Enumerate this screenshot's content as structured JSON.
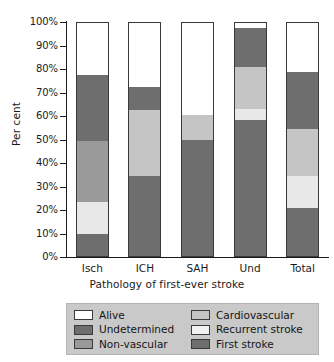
{
  "chart_data": {
    "type": "bar",
    "subtype": "stacked-percentage",
    "title": "",
    "xlabel": "Pathology of first-ever stroke",
    "ylabel": "Per cent",
    "ylim": [
      0,
      100
    ],
    "ytick_labels": [
      "100%",
      "90%",
      "80%",
      "70%",
      "60%",
      "50%",
      "40%",
      "30%",
      "20%",
      "10%",
      "0%"
    ],
    "ytick_values": [
      100,
      90,
      80,
      70,
      60,
      50,
      40,
      30,
      20,
      10,
      0
    ],
    "grid": false,
    "legend_position": "bottom",
    "categories": [
      "Isch",
      "ICH",
      "SAH",
      "Und",
      "Total"
    ],
    "series": [
      {
        "name": "First stroke",
        "color": "#6e6e6e",
        "values": [
          9.5,
          34.0,
          49.5,
          58.0,
          20.5
        ]
      },
      {
        "name": "Recurrent stroke",
        "color": "#e8e8e8",
        "values": [
          13.5,
          0.0,
          0.0,
          4.5,
          13.5
        ]
      },
      {
        "name": "Non-vascular",
        "color": "#9a9a9a",
        "values": [
          26.0,
          0.0,
          0.0,
          0.0,
          0.0
        ]
      },
      {
        "name": "Cardiovascular",
        "color": "#c5c5c5",
        "values": [
          0.0,
          28.0,
          10.5,
          18.0,
          20.0
        ]
      },
      {
        "name": "Undetermined",
        "color": "#6e6e6e",
        "values": [
          28.0,
          10.0,
          0.0,
          16.5,
          24.5
        ]
      },
      {
        "name": "Alive",
        "color": "#ffffff",
        "values": [
          23.0,
          28.0,
          40.0,
          3.0,
          21.5
        ]
      }
    ],
    "stack_order_bottom_to_top": [
      "First stroke",
      "Recurrent stroke",
      "Non-vascular",
      "Cardiovascular",
      "Undetermined",
      "Alive"
    ]
  },
  "legend": {
    "left_column": [
      {
        "label": "Alive",
        "color": "#ffffff"
      },
      {
        "label": "Undetermined",
        "color": "#6e6e6e"
      },
      {
        "label": "Non-vascular",
        "color": "#9a9a9a"
      }
    ],
    "right_column": [
      {
        "label": "Cardiovascular",
        "color": "#c5c5c5"
      },
      {
        "label": "Recurrent stroke",
        "color": "#f2f2f2"
      },
      {
        "label": "First stroke",
        "color": "#6e6e6e"
      }
    ]
  }
}
